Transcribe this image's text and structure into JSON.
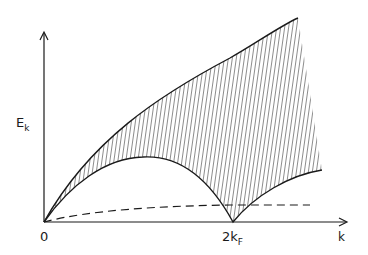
{
  "diagram": {
    "type": "particle-hole excitation continuum",
    "axes": {
      "y_label": "E",
      "y_label_subscript": "k",
      "x_label": "k",
      "origin_label": "0",
      "x_tick_label": "2k",
      "x_tick_label_main": "2k",
      "x_tick_label_subscript": "F"
    },
    "curves": [
      {
        "name": "upper-boundary",
        "style": "solid",
        "description": "rises from origin to maximum at right edge"
      },
      {
        "name": "lower-boundary",
        "style": "solid",
        "description": "arch from origin, maximum near k_F, zero at 2k_F, rising after"
      },
      {
        "name": "collective-mode",
        "style": "dashed",
        "description": "low-lying branch from origin, flattening"
      }
    ],
    "shaded_region": {
      "pattern": "vertical hatching",
      "between": [
        "upper-boundary",
        "lower-boundary"
      ]
    },
    "colors": {
      "ink": "#1a1a1a",
      "background": "#ffffff"
    }
  }
}
